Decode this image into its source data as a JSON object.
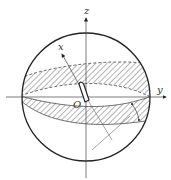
{
  "diagram": {
    "type": "celestial-sphere-zone-diagram",
    "labels": {
      "z_axis": "z",
      "x_axis": "x",
      "y_axis": "y",
      "origin": "O"
    },
    "colors": {
      "stroke": "#222222",
      "hatch": "#444444",
      "background": "#ffffff"
    }
  }
}
